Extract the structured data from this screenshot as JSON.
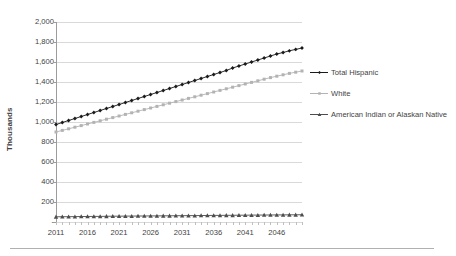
{
  "chart_data": {
    "type": "line",
    "title": "",
    "subtitle": "",
    "xlabel": "",
    "ylabel": "Thousands",
    "xlim": [
      2011,
      2050
    ],
    "ylim": [
      0,
      2000
    ],
    "grid": true,
    "legend_position": "right",
    "x": [
      2011,
      2012,
      2013,
      2014,
      2015,
      2016,
      2017,
      2018,
      2019,
      2020,
      2021,
      2022,
      2023,
      2024,
      2025,
      2026,
      2027,
      2028,
      2029,
      2030,
      2031,
      2032,
      2033,
      2034,
      2035,
      2036,
      2037,
      2038,
      2039,
      2040,
      2041,
      2042,
      2043,
      2044,
      2045,
      2046,
      2047,
      2048,
      2049,
      2050
    ],
    "ytick_labels": [
      "2,000",
      "1,800",
      "1,600",
      "1,400",
      "1,200",
      "1,000",
      "800",
      "600",
      "400",
      "200",
      "-"
    ],
    "ytick_values": [
      2000,
      1800,
      1600,
      1400,
      1200,
      1000,
      800,
      600,
      400,
      200,
      0
    ],
    "xtick_labels": [
      "2011",
      "2016",
      "2021",
      "2026",
      "2031",
      "2036",
      "2041",
      "2046"
    ],
    "xtick_values": [
      2011,
      2016,
      2021,
      2026,
      2031,
      2036,
      2041,
      2046
    ],
    "series": [
      {
        "name": "Total Hispanic",
        "color": "#1a1a1a",
        "marker": "diamond",
        "values": [
          975,
          995,
          1015,
          1035,
          1055,
          1075,
          1095,
          1115,
          1135,
          1155,
          1175,
          1195,
          1215,
          1235,
          1255,
          1275,
          1295,
          1315,
          1335,
          1355,
          1375,
          1395,
          1415,
          1435,
          1455,
          1475,
          1495,
          1515,
          1540,
          1560,
          1580,
          1600,
          1620,
          1640,
          1660,
          1680,
          1695,
          1712,
          1726,
          1740
        ]
      },
      {
        "name": "White",
        "color": "#b3b3b3",
        "marker": "square",
        "values": [
          900,
          916,
          932,
          948,
          964,
          980,
          996,
          1012,
          1028,
          1044,
          1060,
          1076,
          1092,
          1108,
          1124,
          1140,
          1156,
          1172,
          1188,
          1204,
          1220,
          1236,
          1252,
          1268,
          1284,
          1300,
          1316,
          1332,
          1348,
          1364,
          1380,
          1396,
          1412,
          1428,
          1444,
          1458,
          1472,
          1486,
          1498,
          1510
        ]
      },
      {
        "name": "American Indian or Alaskan Native",
        "color": "#4d4d4d",
        "marker": "triangle",
        "values": [
          52,
          53,
          53,
          54,
          55,
          55,
          56,
          56,
          57,
          58,
          58,
          59,
          59,
          60,
          60,
          61,
          61,
          62,
          62,
          63,
          63,
          64,
          64,
          65,
          65,
          66,
          66,
          67,
          67,
          68,
          68,
          69,
          69,
          70,
          70,
          71,
          71,
          72,
          72,
          73
        ]
      }
    ]
  },
  "legend": {
    "items": [
      {
        "label": "Total Hispanic"
      },
      {
        "label": "White"
      },
      {
        "label": "American Indian or Alaskan Native"
      }
    ]
  }
}
